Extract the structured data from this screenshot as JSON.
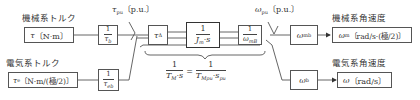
{
  "inputs": {
    "mechanical_torque": {
      "label": "機械系トルク",
      "symbol": "τ",
      "unit": "〔N·m〕"
    },
    "electrical_torque": {
      "label": "電気系トルク",
      "symbol": "τ",
      "sub": "e",
      "unit": "〔N·m/(極/2)〕"
    }
  },
  "blocks": {
    "inv_tau_b": {
      "num": "1",
      "den_sym": "τ",
      "den_sub": "b"
    },
    "inv_tau_eb": {
      "num": "1",
      "den_sym": "τ",
      "den_sub": "eb"
    },
    "tau_delta": {
      "sym": "τ",
      "sub": "Δ"
    },
    "inertia": {
      "num": "1",
      "den_sym": "J",
      "den_sub": "m",
      "den_rest": "·s"
    },
    "inv_omega_mb": {
      "num": "1",
      "den_sym": "ω",
      "den_sub": "mB"
    },
    "omega_mb": {
      "sym": "ω",
      "sub": "mb"
    },
    "omega_b": {
      "sym": "ω",
      "sub": "b"
    }
  },
  "signals": {
    "tau_pu": {
      "sym": "τ",
      "sub": "pu",
      "unit": "〔p.u.〕"
    },
    "omega_pu": {
      "sym": "ω",
      "sub": "pu",
      "unit": "〔p.u.〕"
    }
  },
  "outputs": {
    "mechanical_speed": {
      "label": "機械系角速度",
      "symbol": "ω",
      "sub": "m",
      "unit": "〔rad/s·(極/2)〕"
    },
    "electrical_speed": {
      "label": "電気系角速度",
      "symbol": "ω",
      "unit": "〔rad/s〕"
    }
  },
  "equation": {
    "lhs_num": "1",
    "lhs_den_sym": "T",
    "lhs_den_sub": "M",
    "lhs_den_rest": "·s",
    "sign": "=",
    "rhs_num": "1",
    "rhs_den_sym": "T",
    "rhs_den_sub": "Mpu",
    "rhs_den_rest": "·s",
    "rhs_den_sub2": "pu"
  }
}
